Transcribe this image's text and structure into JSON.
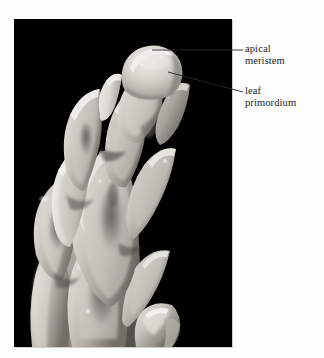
{
  "figure": {
    "domain": "biology-micrograph",
    "background_color": "#fdfdfd",
    "photo": {
      "name": "shoot-apex-photograph",
      "background_color": "#000000",
      "border_color": "#c8c8c8",
      "x": 14,
      "y": 19,
      "width": 218,
      "height": 328,
      "specimen_color_light": "#e8e6e0",
      "specimen_color_mid": "#b5b2ab",
      "specimen_color_shadow": "#6e6c67"
    }
  },
  "annotations": {
    "leader_color": "#2a2a2a",
    "items": [
      {
        "id": "apical-meristem",
        "lines": [
          "apical",
          "meristem"
        ],
        "text": "apical meristem",
        "label_x": 245,
        "label_y": 43,
        "leader": {
          "x1": 152,
          "y1": 50,
          "x2": 243,
          "y2": 50
        }
      },
      {
        "id": "leaf-primordium",
        "lines": [
          "leaf",
          "primordium"
        ],
        "text": "leaf primordium",
        "label_x": 245,
        "label_y": 85,
        "leader": {
          "x1": 168,
          "y1": 72,
          "x2": 243,
          "y2": 92
        }
      }
    ]
  }
}
